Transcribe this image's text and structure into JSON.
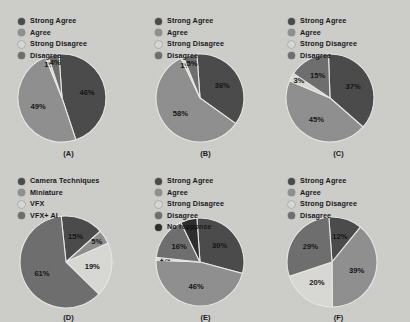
{
  "figure": {
    "background": "#cdcdc9",
    "panel_count": 6
  },
  "palette": {
    "strong_agree": "#4a4a4a",
    "agree": "#8f8f8f",
    "strong_disagree": "#d8d8d4",
    "disagree": "#6e6e6e",
    "no_response": "#2c2c2c",
    "camera_techniques": "#4a4a4a",
    "miniature": "#8f8f8f",
    "vfx": "#d8d8d4",
    "vfx_ai": "#6e6e6e",
    "label_text": "#141416",
    "divider": "#e8e8e4"
  },
  "chart_data": [
    {
      "type": "pie",
      "id": "A",
      "caption": "(A)",
      "title": "",
      "legend_position": "top-left",
      "categories": [
        "Strong Agree",
        "Agree",
        "Strong Disagree",
        "Disagree"
      ],
      "values": [
        46,
        49,
        1,
        4
      ],
      "labels": [
        "46%",
        "49%",
        "1%",
        "4%"
      ],
      "colors": [
        "#4a4a4a",
        "#8f8f8f",
        "#d8d8d4",
        "#6e6e6e"
      ]
    },
    {
      "type": "pie",
      "id": "B",
      "caption": "(B)",
      "title": "",
      "legend_position": "top-left",
      "categories": [
        "Strong Agree",
        "Agree",
        "Strong Disagree",
        "Disagree"
      ],
      "values": [
        36,
        58,
        1,
        5
      ],
      "labels": [
        "36%",
        "58%",
        "1%",
        "5%"
      ],
      "colors": [
        "#4a4a4a",
        "#8f8f8f",
        "#d8d8d4",
        "#6e6e6e"
      ]
    },
    {
      "type": "pie",
      "id": "C",
      "caption": "(C)",
      "title": "",
      "legend_position": "top-left",
      "categories": [
        "Strong Agree",
        "Agree",
        "Strong Disagree",
        "Disagree"
      ],
      "values": [
        37,
        45,
        3,
        15
      ],
      "labels": [
        "37%",
        "45%",
        "3%",
        "15%"
      ],
      "colors": [
        "#4a4a4a",
        "#8f8f8f",
        "#d8d8d4",
        "#6e6e6e"
      ]
    },
    {
      "type": "pie",
      "id": "D",
      "caption": "(D)",
      "title": "",
      "legend_position": "top-left",
      "categories": [
        "Camera Techniques",
        "Miniature",
        "VFX",
        "VFX+ AI"
      ],
      "values": [
        15,
        5,
        19,
        61
      ],
      "labels": [
        "15%",
        "5%",
        "19%",
        "61%"
      ],
      "colors": [
        "#4a4a4a",
        "#8f8f8f",
        "#d8d8d4",
        "#6e6e6e"
      ]
    },
    {
      "type": "pie",
      "id": "E",
      "caption": "(E)",
      "title": "",
      "legend_position": "top-left",
      "categories": [
        "Strong Agree",
        "Agree",
        "Strong Disagree",
        "Disagree",
        "No response"
      ],
      "values": [
        30,
        46,
        1,
        16,
        6
      ],
      "labels": [
        "30%",
        "46%",
        "1%",
        "16%",
        "6%"
      ],
      "colors": [
        "#4a4a4a",
        "#8f8f8f",
        "#d8d8d4",
        "#6e6e6e",
        "#2c2c2c"
      ]
    },
    {
      "type": "pie",
      "id": "F",
      "caption": "(F)",
      "title": "",
      "legend_position": "top-left",
      "categories": [
        "Strong Agree",
        "Agree",
        "Strong Disagree",
        "Disagree"
      ],
      "values": [
        12,
        39,
        20,
        29
      ],
      "labels": [
        "12%",
        "39%",
        "20%",
        "29%"
      ],
      "colors": [
        "#4a4a4a",
        "#8f8f8f",
        "#d8d8d4",
        "#6e6e6e"
      ]
    }
  ]
}
